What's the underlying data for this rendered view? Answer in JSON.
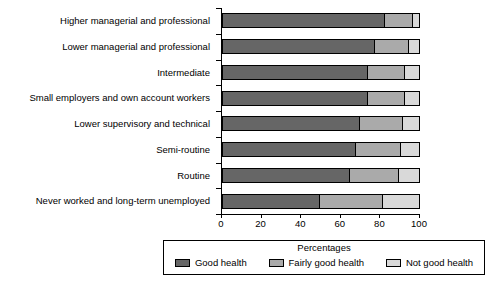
{
  "chart_data": {
    "type": "bar",
    "orientation": "horizontal",
    "stacked": true,
    "title": "",
    "xlabel": "",
    "ylabel": "",
    "xlim": [
      0,
      100
    ],
    "xticks": [
      "0",
      "20",
      "40",
      "60",
      "80",
      "100"
    ],
    "grid": false,
    "legend_position": "bottom",
    "legend_title": "Percentages",
    "categories": [
      "Higher managerial and professional",
      "Lower managerial and professional",
      "Intermediate",
      "Small employers and own account workers",
      "Lower supervisory and technical",
      "Semi-routine",
      "Routine",
      "Never worked and long-term unemployed"
    ],
    "series": [
      {
        "name": "Good health",
        "color": "#666666",
        "values": [
          82,
          77,
          73,
          73,
          69,
          67,
          64,
          49
        ]
      },
      {
        "name": "Fairly good health",
        "color": "#AAAAAA",
        "values": [
          14,
          17,
          19,
          19,
          22,
          23,
          25,
          32
        ]
      },
      {
        "name": "Not good health",
        "color": "#D9D9D9",
        "values": [
          4,
          6,
          8,
          8,
          9,
          10,
          11,
          19
        ]
      }
    ]
  }
}
